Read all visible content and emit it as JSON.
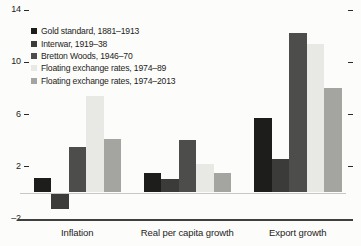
{
  "chart_data": {
    "type": "bar",
    "title": "",
    "xlabel": "",
    "ylabel": "",
    "categories": [
      "Inflation",
      "Real per capita growth",
      "Export growth"
    ],
    "series": [
      {
        "name": "Gold standard, 1881–1913",
        "color": "#1d1d1b",
        "values": [
          1.1,
          1.5,
          5.7
        ]
      },
      {
        "name": "Interwar, 1919–38",
        "color": "#3b3b39",
        "values": [
          -1.2,
          1.0,
          2.6
        ]
      },
      {
        "name": "Bretton Woods, 1946–70",
        "color": "#4d4d4b",
        "values": [
          3.5,
          4.0,
          12.2
        ]
      },
      {
        "name": "Floating exchange rates, 1974–89",
        "color": "#e8e8e4",
        "values": [
          7.4,
          2.2,
          11.4
        ]
      },
      {
        "name": "Floating exchange rates, 1974–2013",
        "color": "#a4a4a0",
        "values": [
          4.1,
          1.5,
          8.0
        ]
      }
    ],
    "ylim": [
      -2,
      14
    ],
    "yticks": [
      14,
      10,
      6,
      2,
      -2
    ],
    "ytick_labels": [
      "14",
      "10",
      "6",
      "2",
      "–2"
    ],
    "grid": "zero-line-only",
    "legend_position": "top-left",
    "background": "#fcfcfa"
  }
}
